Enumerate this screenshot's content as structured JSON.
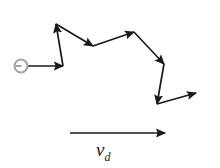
{
  "figure": {
    "background_color": "#ffffff",
    "stroke_color": "#1a1a1a",
    "particle": {
      "name": "electron",
      "fill_color": "#ffffff",
      "ring_color": "#9a9a9a",
      "cx": 21,
      "cy": 66,
      "r": 6.5
    },
    "path_segments": [
      {
        "label": "segment-1",
        "x1": 28,
        "y1": 66,
        "x2": 63,
        "y2": 66
      },
      {
        "label": "segment-2",
        "x1": 63,
        "y1": 66,
        "x2": 56,
        "y2": 24
      },
      {
        "label": "segment-3",
        "x1": 56,
        "y1": 24,
        "x2": 93,
        "y2": 46
      },
      {
        "label": "segment-4",
        "x1": 93,
        "y1": 46,
        "x2": 134,
        "y2": 32
      },
      {
        "label": "segment-5",
        "x1": 134,
        "y1": 32,
        "x2": 164,
        "y2": 64
      },
      {
        "label": "segment-6",
        "x1": 164,
        "y1": 64,
        "x2": 157,
        "y2": 104
      },
      {
        "label": "segment-7",
        "x1": 157,
        "y1": 104,
        "x2": 196,
        "y2": 93
      }
    ],
    "drift_vector": {
      "label_text": "v",
      "label_subscript": "d",
      "x1": 70,
      "y1": 133,
      "x2": 165,
      "y2": 133,
      "label_x": 96,
      "label_y": 141
    }
  }
}
